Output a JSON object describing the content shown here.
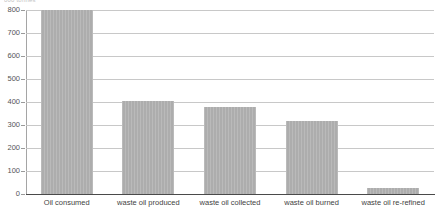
{
  "axis_caption": "000 tonnes",
  "colors": {
    "bar_fill": "#adadad",
    "gridline": "#c8c8c8",
    "axis_line": "#a5a5a5",
    "baseline": "#4a4a4a",
    "tick_text": "#555555",
    "category_text": "#3f3f3f",
    "background": "#ffffff"
  },
  "chart_data": {
    "type": "bar",
    "title": "",
    "subtitle": "",
    "xlabel": "",
    "ylabel": "000 tonnes",
    "ylim": [
      0,
      800
    ],
    "ytick_step": 100,
    "yticks": [
      0,
      100,
      200,
      300,
      400,
      500,
      600,
      700,
      800
    ],
    "ytick_labels": [
      "0",
      "100",
      "200",
      "300",
      "400",
      "500",
      "600",
      "700",
      "800"
    ],
    "grid": true,
    "legend": false,
    "legend_position": "none",
    "orientation": "vertical",
    "categories": [
      "Oil consumed",
      "waste oil produced",
      "waste oil collected",
      "waste oil burned",
      "waste oil re-refined"
    ],
    "values": [
      800,
      405,
      378,
      318,
      25
    ],
    "series": [
      {
        "name": "",
        "values": [
          800,
          405,
          378,
          318,
          25
        ],
        "color": "#adadad"
      }
    ],
    "annotations": []
  }
}
